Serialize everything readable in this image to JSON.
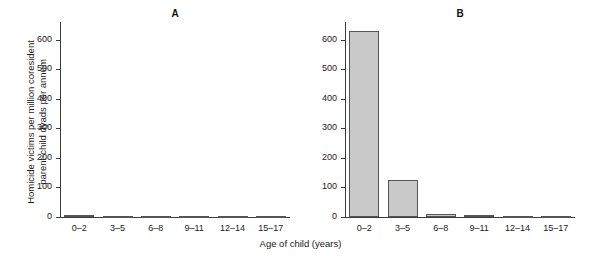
{
  "chart_data": {
    "type": "bar",
    "title": "",
    "xlabel": "Age of child (years)",
    "ylabel": "Homicide victims per million coresident\nparent-child dyads per annum",
    "categories": [
      "0–2",
      "3–5",
      "6–8",
      "9–11",
      "12–14",
      "15–17"
    ],
    "yticks": [
      0,
      100,
      200,
      300,
      400,
      500,
      600
    ],
    "ylim": [
      0,
      660
    ],
    "grid": false,
    "legend": null,
    "panels": [
      {
        "label": "A",
        "values": [
          8,
          2,
          3,
          1,
          1,
          1
        ]
      },
      {
        "label": "B",
        "values": [
          628,
          126,
          11,
          8,
          4,
          3
        ]
      }
    ]
  },
  "colors": {
    "bar_fill": "#c9c9c9",
    "bar_stroke": "#555555",
    "axis": "#3b3b3b",
    "text": "#1a1a1a",
    "background": "#ffffff"
  }
}
